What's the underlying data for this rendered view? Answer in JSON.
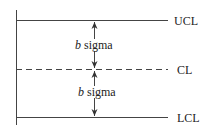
{
  "diagram": {
    "type": "control-chart-limits",
    "lines": {
      "ucl": {
        "label": "UCL",
        "style": "solid"
      },
      "cl": {
        "label": "CL",
        "style": "dashed"
      },
      "lcl": {
        "label": "LCL",
        "style": "solid"
      }
    },
    "spans": [
      {
        "var": "b",
        "text": " sigma",
        "between": "UCL-CL"
      },
      {
        "var": "b",
        "text": " sigma",
        "between": "CL-LCL"
      }
    ],
    "line_color": "#444444"
  }
}
